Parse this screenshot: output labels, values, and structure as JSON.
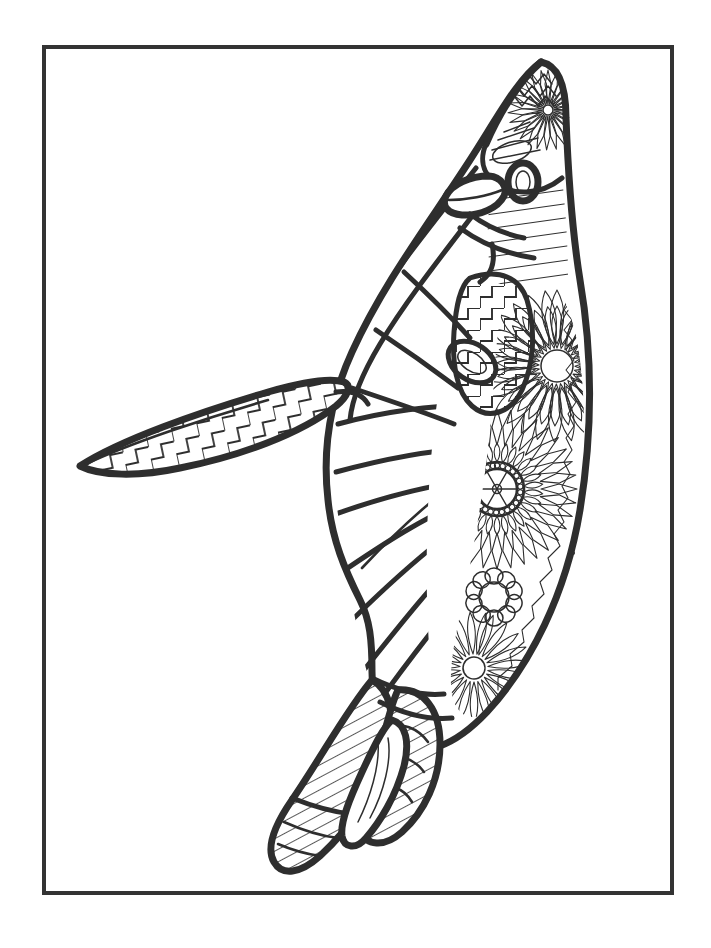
{
  "page": {
    "width": 711,
    "height": 948,
    "background_color": "#ffffff",
    "ink_color": "#2e2e2e"
  },
  "frame": {
    "name": "page-border",
    "x": 42,
    "y": 45,
    "width": 632,
    "height": 850,
    "stroke_color": "#333333",
    "stroke_width": 4
  },
  "artwork": {
    "subject": "penguin",
    "style": "zentangle line art coloring page",
    "fill": "none",
    "line_color": "#2e2e2e",
    "parts": [
      {
        "name": "head",
        "pattern": "sunburst-fan and chevron",
        "label": "Head"
      },
      {
        "name": "beak",
        "pattern": "plain outline",
        "label": "Beak"
      },
      {
        "name": "eye",
        "pattern": "thick ring oval",
        "label": "Eye"
      },
      {
        "name": "neck",
        "pattern": "horizontal bands",
        "label": "Neck"
      },
      {
        "name": "wing",
        "pattern": "long curved bands",
        "label": "Wing"
      },
      {
        "name": "flipper",
        "pattern": "stepped zigzag",
        "label": "Flipper"
      },
      {
        "name": "chest",
        "pattern": "chevron zigzag",
        "label": "Chest"
      },
      {
        "name": "back",
        "pattern": "radiating petals and mandala flowers",
        "label": "Back"
      },
      {
        "name": "belly",
        "pattern": "flowing curved contour lines",
        "label": "Belly"
      },
      {
        "name": "feet",
        "pattern": "parallel stripes and leaf shapes",
        "label": "Feet"
      }
    ],
    "motifs": [
      {
        "name": "sunflower-mandala",
        "center_x": 497,
        "center_y": 489,
        "radius": 62,
        "petal_count": 36,
        "bead_count": 26
      },
      {
        "name": "petal-flower-upper",
        "center_x": 557,
        "center_y": 366,
        "radius": 52,
        "petal_count": 28
      },
      {
        "name": "round-petal-flower",
        "center_x": 494,
        "center_y": 597,
        "radius": 26,
        "petal_count": 10
      },
      {
        "name": "fan-burst-lower",
        "center_x": 474,
        "center_y": 668,
        "radius": 46,
        "petal_count": 22
      },
      {
        "name": "head-sunburst",
        "center_x": 546,
        "center_y": 104,
        "radius": 26,
        "petal_count": 20
      }
    ],
    "speck": {
      "name": "ink-speck",
      "x": 573,
      "y": 553,
      "radius": 2
    }
  }
}
